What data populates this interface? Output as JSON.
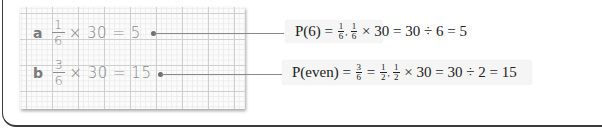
{
  "working": {
    "rows": [
      {
        "label": "a",
        "fraction": {
          "num": "1",
          "den": "6"
        },
        "expression": "× 30 = 5"
      },
      {
        "label": "b",
        "fraction": {
          "num": "3",
          "den": "6"
        },
        "expression": "× 30 = 15"
      }
    ]
  },
  "callouts": [
    {
      "lhs": "P(6) = ",
      "f1": {
        "num": "1",
        "den": "6"
      },
      "sep": ", ",
      "f2": {
        "num": "1",
        "den": "6"
      },
      "rest": " × 30 = 30 ÷ 6 = 5"
    },
    {
      "lhs": "P(even) = ",
      "f0": {
        "num": "3",
        "den": "6"
      },
      "eq": " = ",
      "f1": {
        "num": "1",
        "den": "2"
      },
      "sep": ", ",
      "f2": {
        "num": "1",
        "den": "2"
      },
      "rest": " × 30 = 30 ÷ 2 = 15"
    }
  ],
  "colors": {
    "grid_major": "#cfcfcf",
    "grid_minor": "#ececec",
    "handwriting": "#8a8a8a",
    "callout_bg": "#f5f5f5",
    "frame": "#3a3a3a"
  }
}
